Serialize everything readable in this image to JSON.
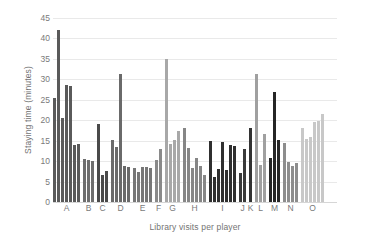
{
  "chart_data": {
    "type": "bar",
    "title": "",
    "xlabel": "Library visits per player",
    "ylabel": "Staying time (minutes)",
    "ylim": [
      0,
      45
    ],
    "yticks": [
      0,
      5,
      10,
      15,
      20,
      25,
      30,
      35,
      40,
      45
    ],
    "grid": true,
    "legend": "none",
    "categories": [
      "A",
      "B",
      "C",
      "D",
      "E",
      "F",
      "G",
      "H",
      "I",
      "J",
      "K",
      "L",
      "M",
      "N",
      "O"
    ],
    "note": "Each category label marks a group of consecutive bars; one bar per player visit record.",
    "groups": [
      {
        "label": "A",
        "color": "#5a5a5a",
        "values": [
          25.5,
          42.0,
          20.5,
          28.5,
          28.3,
          14.0,
          14.2
        ]
      },
      {
        "label": "B",
        "color": "#6e6e6e",
        "values": [
          10.4,
          10.3,
          10.0
        ]
      },
      {
        "label": "C",
        "color": "#4a4a4a",
        "values": [
          19.0,
          6.6,
          7.7
        ]
      },
      {
        "label": "D",
        "color": "#6a6a6a",
        "values": [
          15.2,
          13.5,
          31.4,
          8.7,
          8.6
        ]
      },
      {
        "label": "E",
        "color": "#777777",
        "values": [
          8.2,
          7.4,
          8.5,
          8.6,
          8.2
        ]
      },
      {
        "label": "F",
        "color": "#8a8a8a",
        "values": [
          10.2,
          13.0
        ]
      },
      {
        "label": "G",
        "color": "#a8a8a8",
        "values": [
          34.9,
          14.3,
          15.2,
          17.3
        ]
      },
      {
        "label": "H",
        "color": "#868686",
        "values": [
          18.0,
          13.2,
          8.4,
          10.8,
          8.9,
          6.6
        ]
      },
      {
        "label": "I",
        "color": "#2f2f2f",
        "values": [
          15.0,
          6.2,
          8.1,
          14.6,
          7.8,
          14.0,
          13.7
        ]
      },
      {
        "label": "J",
        "color": "#3a3a3a",
        "values": [
          7.0,
          12.9
        ]
      },
      {
        "label": "K",
        "color": "#333333",
        "values": [
          18.2
        ]
      },
      {
        "label": "L",
        "color": "#a0a0a0",
        "values": [
          31.3,
          9.0,
          16.7
        ]
      },
      {
        "label": "M",
        "color": "#262626",
        "values": [
          10.8,
          27.0,
          15.1
        ]
      },
      {
        "label": "N",
        "color": "#8d8d8d",
        "values": [
          14.4,
          9.7,
          8.8,
          9.6
        ]
      },
      {
        "label": "O",
        "color": "#c8c8c8",
        "values": [
          18.2,
          15.4,
          15.9,
          19.6,
          19.9,
          21.6
        ]
      }
    ]
  },
  "axes": {
    "y_tick_labels": [
      "0",
      "5",
      "10",
      "15",
      "20",
      "25",
      "30",
      "35",
      "40",
      "45"
    ],
    "x_tick_labels": [
      "A",
      "B",
      "C",
      "D",
      "E",
      "F",
      "G",
      "H",
      "I",
      "J",
      "K",
      "L",
      "M",
      "N",
      "O"
    ],
    "y_axis_title": "Staying time (minutes)",
    "x_axis_title": "Library visits per player"
  },
  "style": {
    "background": "#ffffff",
    "gridline_color": "#e9e9e9",
    "text_color": "#7a7a7a"
  }
}
